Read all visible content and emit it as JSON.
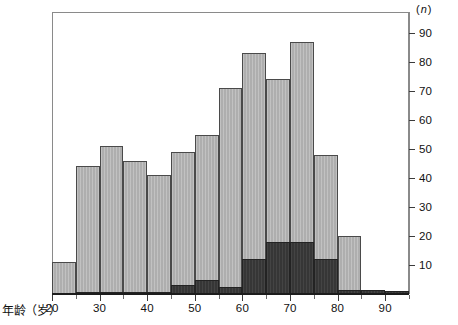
{
  "figure": {
    "x_axis_title": "年龄（岁）",
    "y_axis_title_prefix": "(",
    "y_axis_title_symbol": "n",
    "y_axis_title_suffix": ")"
  },
  "chart_data": {
    "type": "bar",
    "title": "",
    "xlabel": "年龄（岁）",
    "ylabel": "(n)",
    "xlim": [
      20,
      95
    ],
    "ylim": [
      0,
      95
    ],
    "grid": false,
    "legend": "none",
    "bin_width": 5,
    "stacked": true,
    "categories": [
      "20-25",
      "25-30",
      "30-35",
      "35-40",
      "40-45",
      "45-50",
      "50-55",
      "55-60",
      "60-65",
      "65-70",
      "70-75",
      "75-80",
      "80-85",
      "85-90",
      "90-95"
    ],
    "bin_starts": [
      20,
      25,
      30,
      35,
      40,
      45,
      50,
      55,
      60,
      65,
      70,
      75,
      80,
      85,
      90
    ],
    "series": [
      {
        "name": "total",
        "values": [
          11,
          44,
          51,
          46,
          41,
          49,
          55,
          71,
          83,
          74,
          87,
          48,
          20,
          1.5,
          1
        ]
      },
      {
        "name": "dark-subgroup",
        "values": [
          0,
          0.6,
          0.6,
          0.6,
          0.6,
          3,
          5,
          2.5,
          12,
          18,
          18,
          12,
          1.5,
          1.5,
          1
        ]
      }
    ],
    "x_ticks_major": [
      20,
      30,
      40,
      50,
      60,
      70,
      80,
      90
    ],
    "x_ticks_minor": [
      25,
      35,
      45,
      55,
      65,
      75,
      85,
      95
    ],
    "x_tick_labels": [
      "20",
      "30",
      "40",
      "50",
      "60",
      "70",
      "80",
      "90"
    ],
    "y_ticks": [
      10,
      20,
      30,
      40,
      50,
      60,
      70,
      80,
      90
    ],
    "y_tick_labels": [
      "10",
      "20",
      "30",
      "40",
      "50",
      "60",
      "70",
      "80",
      "90"
    ],
    "y_axis_position": "right",
    "colors": {
      "light_bar": "#b4b4b4",
      "dark_bar": "#3a3a3a",
      "bar_border": "#4a4a4a",
      "axis": "#1c1c1c",
      "frame": "#8a8a8a",
      "text": "#111111",
      "background": "#ffffff"
    }
  }
}
